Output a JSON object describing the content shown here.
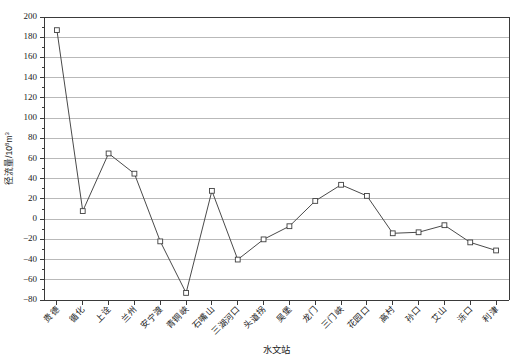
{
  "chart_data": {
    "type": "line",
    "title": "",
    "xlabel": "水文站",
    "ylabel": "径流量/10⁸m³",
    "ylim": [
      -80,
      200
    ],
    "ytick_step": 20,
    "grid": true,
    "legend": "none",
    "marker": "open-square",
    "line_color": "#4a4a4a",
    "grid_color": "#a8a8a8",
    "axis_color": "#3a3a3a",
    "categories": [
      "贵德",
      "循化",
      "上诠",
      "兰州",
      "安宁渡",
      "青铜峡",
      "石嘴山",
      "三湖河口",
      "头道拐",
      "吴堡",
      "龙门",
      "三门峡",
      "花园口",
      "高村",
      "孙口",
      "艾山",
      "泺口",
      "利津"
    ],
    "values": [
      187,
      8,
      65,
      45,
      -22,
      -73,
      28,
      -40,
      -20,
      -7,
      18,
      34,
      23,
      -14,
      -13,
      -6,
      -23,
      -31
    ],
    "yticks": [
      200,
      180,
      160,
      140,
      120,
      100,
      80,
      60,
      40,
      20,
      0,
      -20,
      -40,
      -60,
      -80
    ],
    "ytick_labels": [
      "200",
      "180",
      "160",
      "140",
      "120",
      "100",
      "80",
      "60",
      "40",
      "20",
      "0",
      "−20",
      "−40",
      "−60",
      "−80"
    ]
  }
}
